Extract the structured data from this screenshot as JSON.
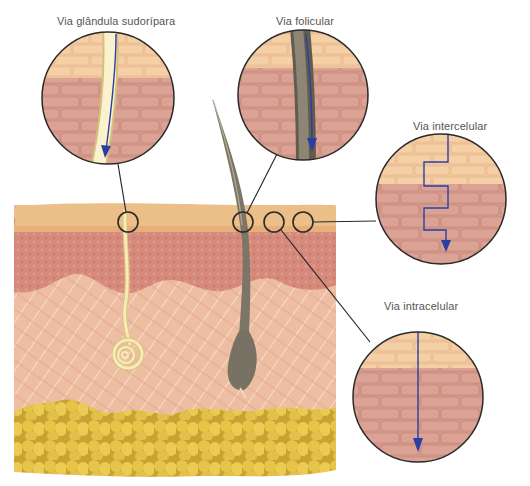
{
  "diagram": {
    "type": "skin-penetration-routes",
    "labels": {
      "sweat_gland": "Via glândula sudorípara",
      "follicular": "Via folicular",
      "intercellular": "Via intercelular",
      "intracellular": "Via intracelular"
    },
    "callouts": [
      {
        "id": "sweat_gland",
        "label": "Via glândula sudorípara",
        "path": "through sweat duct"
      },
      {
        "id": "follicular",
        "label": "Via folicular",
        "path": "along hair follicle"
      },
      {
        "id": "intercellular",
        "label": "Via intercelular",
        "path": "zig-zag between cells"
      },
      {
        "id": "intracellular",
        "label": "Via intracelular",
        "path": "straight through cells"
      }
    ],
    "layers": [
      "stratum corneum",
      "epidermis",
      "dermis",
      "hypodermis (adipose)"
    ],
    "colors": {
      "stratum_corneum": "#eec38f",
      "epidermis": "#d98b7e",
      "dermis": "#edbc9f",
      "fat": "#e0bc43",
      "hair": "#6f6a5c",
      "duct": "#f5e6b0",
      "arrow": "#2b3fa0",
      "outline": "#2a2a2a",
      "brick_top": "#f3c9a0",
      "brick_bottom": "#d99a88"
    }
  }
}
